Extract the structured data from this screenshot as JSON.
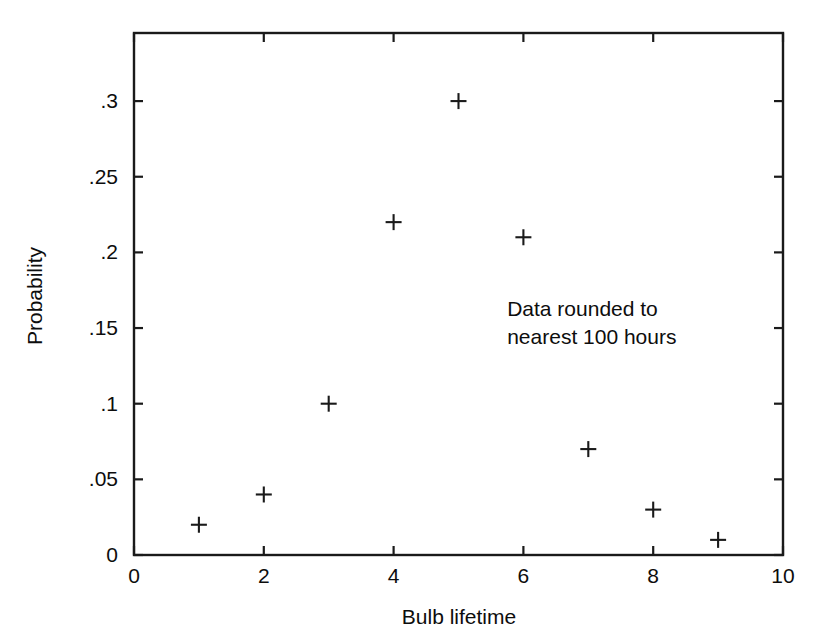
{
  "chart_data": {
    "type": "scatter",
    "title": "",
    "xlabel": "Bulb lifetime",
    "ylabel": "Probability",
    "xlim": [
      0,
      10
    ],
    "ylim": [
      0,
      0.345
    ],
    "grid": false,
    "legend": null,
    "marker": "plus",
    "marker_color": "#1a1a1a",
    "x": [
      1,
      2,
      3,
      4,
      5,
      6,
      7,
      8,
      9
    ],
    "values": [
      0.02,
      0.04,
      0.1,
      0.22,
      0.3,
      0.21,
      0.07,
      0.03,
      0.01
    ],
    "points": [
      {
        "x": 1,
        "y": 0.02
      },
      {
        "x": 2,
        "y": 0.04
      },
      {
        "x": 3,
        "y": 0.1
      },
      {
        "x": 4,
        "y": 0.22
      },
      {
        "x": 5,
        "y": 0.3
      },
      {
        "x": 6,
        "y": 0.21
      },
      {
        "x": 7,
        "y": 0.07
      },
      {
        "x": 8,
        "y": 0.03
      },
      {
        "x": 9,
        "y": 0.01
      }
    ],
    "xticks": [
      0,
      2,
      4,
      6,
      8,
      10
    ],
    "xtick_labels": [
      "0",
      "2",
      "4",
      "6",
      "8",
      "10"
    ],
    "yticks": [
      0,
      0.05,
      0.1,
      0.15,
      0.2,
      0.25,
      0.3
    ],
    "ytick_labels": [
      "0",
      ".05",
      ".1",
      ".15",
      ".2",
      ".25",
      ".3"
    ],
    "annotations": [
      {
        "lines": [
          "Data rounded to",
          "nearest 100 hours"
        ],
        "x": 5.75,
        "y": 0.158
      }
    ]
  },
  "axis_labels": {
    "x_title": "Bulb lifetime",
    "y_title": "Probability"
  },
  "annotation": {
    "line1": "Data rounded to",
    "line2": "nearest 100 hours"
  },
  "colors": {
    "ink": "#1a1a1a",
    "background": "#ffffff",
    "marker": "#1a1a1a"
  }
}
